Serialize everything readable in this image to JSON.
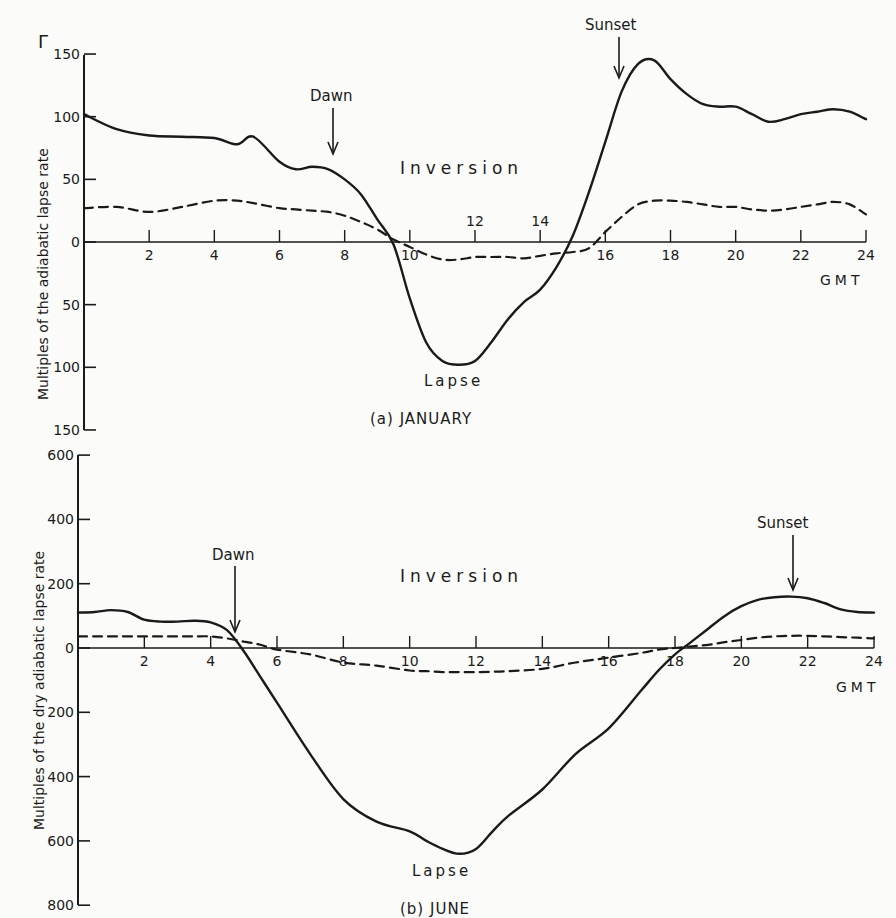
{
  "chart_data": [
    {
      "type": "line",
      "panel": "a",
      "title": "(a) JANUARY",
      "xlabel": "GMT",
      "ylabel": "Multiples of the adiabatic lapse rate",
      "y_symbol": "Γ",
      "xlim": [
        0,
        24
      ],
      "ylim": [
        -150,
        150
      ],
      "x_ticks": [
        "2",
        "4",
        "6",
        "8",
        "10",
        "12",
        "14",
        "16",
        "18",
        "20",
        "22",
        "24"
      ],
      "y_ticks_above": [
        "150",
        "100",
        "50",
        "0"
      ],
      "y_ticks_below": [
        "50",
        "100",
        "150"
      ],
      "region_labels": {
        "upper": "Inversion",
        "lower": "Lapse"
      },
      "annotations": [
        {
          "text": "Dawn",
          "x": 7.6
        },
        {
          "text": "Sunset",
          "x": 16.5
        }
      ],
      "x": [
        0,
        1,
        2,
        3,
        4,
        4.7,
        5.2,
        6,
        6.5,
        7,
        7.5,
        8,
        8.5,
        9,
        9.5,
        10,
        10.5,
        11,
        11.5,
        12,
        12.5,
        13,
        13.5,
        14,
        14.5,
        15,
        15.5,
        16,
        16.5,
        17,
        17.5,
        18,
        18.5,
        19,
        19.5,
        20,
        20.5,
        21,
        21.5,
        22,
        22.5,
        23,
        23.5,
        24
      ],
      "series": [
        {
          "name": "solid",
          "style": "solid",
          "values": [
            102,
            90,
            85,
            84,
            83,
            78,
            84,
            64,
            58,
            60,
            58,
            50,
            38,
            18,
            -2,
            -45,
            -80,
            -95,
            -98,
            -95,
            -80,
            -62,
            -48,
            -38,
            -20,
            5,
            40,
            80,
            120,
            142,
            145,
            130,
            118,
            110,
            108,
            108,
            102,
            96,
            98,
            102,
            104,
            106,
            104,
            98
          ]
        },
        {
          "name": "dashed",
          "style": "dashed",
          "values": [
            27,
            28,
            24,
            28,
            33,
            33,
            31,
            27,
            26,
            25,
            24,
            21,
            16,
            10,
            2,
            -4,
            -10,
            -14,
            -14,
            -12,
            -12,
            -12,
            -13,
            -11,
            -9,
            -8,
            -5,
            8,
            20,
            30,
            33,
            33,
            32,
            30,
            28,
            28,
            26,
            25,
            26,
            28,
            30,
            32,
            30,
            22
          ]
        }
      ]
    },
    {
      "type": "line",
      "panel": "b",
      "title": "(b) JUNE",
      "xlabel": "GMT",
      "ylabel": "Multiples of the dry adiabatic lapse rate",
      "xlim": [
        0,
        24
      ],
      "ylim": [
        -800,
        600
      ],
      "x_ticks": [
        "2",
        "4",
        "6",
        "8",
        "10",
        "12",
        "14",
        "16",
        "18",
        "20",
        "22",
        "24"
      ],
      "y_ticks_above": [
        "600",
        "400",
        "200",
        "0"
      ],
      "y_ticks_below": [
        "200",
        "400",
        "600",
        "800"
      ],
      "region_labels": {
        "upper": "Inversion",
        "lower": "Lapse"
      },
      "annotations": [
        {
          "text": "Dawn",
          "x": 4.8
        },
        {
          "text": "Sunset",
          "x": 21.5
        }
      ],
      "x": [
        0,
        0.5,
        1,
        1.5,
        2,
        2.5,
        3,
        3.5,
        4,
        4.5,
        5,
        5.5,
        6,
        7,
        8,
        9,
        10,
        10.5,
        11,
        11.5,
        12,
        12.5,
        13,
        14,
        15,
        16,
        17,
        17.5,
        18,
        18.5,
        19,
        19.5,
        20,
        20.5,
        21,
        21.5,
        22,
        22.5,
        23,
        23.5,
        24
      ],
      "series": [
        {
          "name": "solid",
          "style": "solid",
          "values": [
            110,
            112,
            118,
            112,
            88,
            82,
            82,
            85,
            80,
            55,
            -10,
            -90,
            -170,
            -330,
            -470,
            -540,
            -570,
            -600,
            -625,
            -640,
            -625,
            -570,
            -520,
            -440,
            -330,
            -250,
            -130,
            -70,
            -20,
            20,
            60,
            100,
            130,
            150,
            158,
            160,
            155,
            140,
            120,
            112,
            110
          ]
        },
        {
          "name": "dashed",
          "style": "dashed",
          "values": [
            36,
            36,
            36,
            36,
            36,
            36,
            36,
            36,
            36,
            30,
            20,
            10,
            -5,
            -20,
            -45,
            -55,
            -70,
            -72,
            -75,
            -75,
            -75,
            -74,
            -72,
            -65,
            -45,
            -30,
            -15,
            -5,
            0,
            5,
            10,
            18,
            25,
            32,
            36,
            38,
            38,
            36,
            34,
            32,
            30
          ]
        }
      ]
    }
  ]
}
